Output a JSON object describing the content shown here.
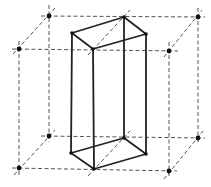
{
  "diagram": {
    "colors": {
      "background": "#ffffff",
      "dashed_line": "#555555",
      "solid_line": "#222222",
      "node": "#111111"
    },
    "lattice_nodes": [
      {
        "id": "back-top-left",
        "x": 49,
        "y": 16
      },
      {
        "id": "back-top-right",
        "x": 198,
        "y": 17
      },
      {
        "id": "front-top-left",
        "x": 19,
        "y": 49
      },
      {
        "id": "front-top-right",
        "x": 169,
        "y": 51
      },
      {
        "id": "back-bottom-left",
        "x": 49,
        "y": 136
      },
      {
        "id": "back-bottom-right",
        "x": 198,
        "y": 138
      },
      {
        "id": "front-bottom-left",
        "x": 19,
        "y": 168
      },
      {
        "id": "front-bottom-right",
        "x": 169,
        "y": 171
      }
    ],
    "dashed_lines": [
      {
        "id": "h-back-top",
        "x1": 41,
        "y1": 16,
        "x2": 205,
        "y2": 17
      },
      {
        "id": "h-front-top",
        "x1": 12,
        "y1": 49,
        "x2": 178,
        "y2": 51
      },
      {
        "id": "h-back-bottom",
        "x1": 41,
        "y1": 136,
        "x2": 205,
        "y2": 138
      },
      {
        "id": "h-front-bottom",
        "x1": 12,
        "y1": 168,
        "x2": 177,
        "y2": 171
      },
      {
        "id": "v-back-left",
        "x1": 49,
        "y1": 5,
        "x2": 49,
        "y2": 142
      },
      {
        "id": "v-back-right",
        "x1": 198,
        "y1": 8,
        "x2": 198,
        "y2": 144
      },
      {
        "id": "v-front-left",
        "x1": 19,
        "y1": 41,
        "x2": 19,
        "y2": 176
      },
      {
        "id": "v-front-right",
        "x1": 169,
        "y1": 42,
        "x2": 169,
        "y2": 178
      },
      {
        "id": "d-top-left",
        "x1": 13,
        "y1": 54,
        "x2": 55,
        "y2": 8
      },
      {
        "id": "d-top-right",
        "x1": 164,
        "y1": 57,
        "x2": 202,
        "y2": 10
      },
      {
        "id": "d-bottom-left",
        "x1": 14,
        "y1": 175,
        "x2": 55,
        "y2": 130
      },
      {
        "id": "d-bottom-right",
        "x1": 164,
        "y1": 179,
        "x2": 203,
        "y2": 131
      },
      {
        "id": "d-prism-top",
        "x1": 88,
        "y1": 55,
        "x2": 130,
        "y2": 10
      },
      {
        "id": "d-prism-bottom",
        "x1": 88,
        "y1": 176,
        "x2": 130,
        "y2": 131
      }
    ],
    "prism": {
      "top_face": "72,33 124,17 146,34 93,49",
      "bottom_face": "71,153 124,138 146,154 94,169",
      "vertical_edges": [
        {
          "id": "edge-left",
          "x1": 72,
          "y1": 33,
          "x2": 71,
          "y2": 153
        },
        {
          "id": "edge-back",
          "x1": 124,
          "y1": 17,
          "x2": 124,
          "y2": 138
        },
        {
          "id": "edge-right",
          "x1": 146,
          "y1": 34,
          "x2": 146,
          "y2": 154
        },
        {
          "id": "edge-front",
          "x1": 93,
          "y1": 49,
          "x2": 94,
          "y2": 169
        }
      ],
      "vertices": [
        {
          "x": 72,
          "y": 33
        },
        {
          "x": 124,
          "y": 17
        },
        {
          "x": 146,
          "y": 34
        },
        {
          "x": 93,
          "y": 49
        },
        {
          "x": 71,
          "y": 153
        },
        {
          "x": 124,
          "y": 138
        },
        {
          "x": 146,
          "y": 154
        },
        {
          "x": 94,
          "y": 169
        }
      ]
    }
  }
}
